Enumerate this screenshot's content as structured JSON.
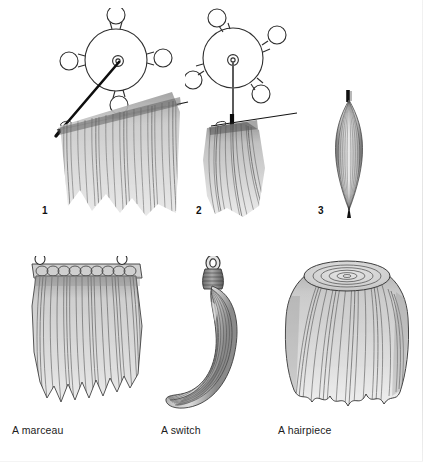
{
  "page": {
    "background_color": "#ffffff",
    "width": 423,
    "height": 462
  },
  "palette": {
    "ink": "#1a1a1a",
    "outline": "#3a3a3a",
    "hair_light": "#d7d7d7",
    "hair_mid": "#b4b4b4",
    "hair_dark": "#7d7d7d",
    "strand": "#4a4a4a",
    "label_text": "#1c1c1c"
  },
  "top_row": {
    "figures": [
      {
        "number": "1",
        "name": "weaving-wheel-angled",
        "description": "Weaving wheel with bobbins and angled needle drawing hair onto the weft thread",
        "annotations": [
          "arrow-left"
        ]
      },
      {
        "number": "2",
        "name": "weaving-wheel-upright",
        "description": "Weaving wheel with upright needle and hair gathered at the weft",
        "annotations": []
      },
      {
        "number": "3",
        "name": "hair-bundle",
        "description": "Finished bundle of hair tapered at both ends",
        "annotations": []
      }
    ]
  },
  "bottom_row": {
    "items": [
      {
        "name": "marceau",
        "label": "A marceau"
      },
      {
        "name": "switch",
        "label": "A switch"
      },
      {
        "name": "hairpiece",
        "label": "A hairpiece"
      }
    ]
  }
}
